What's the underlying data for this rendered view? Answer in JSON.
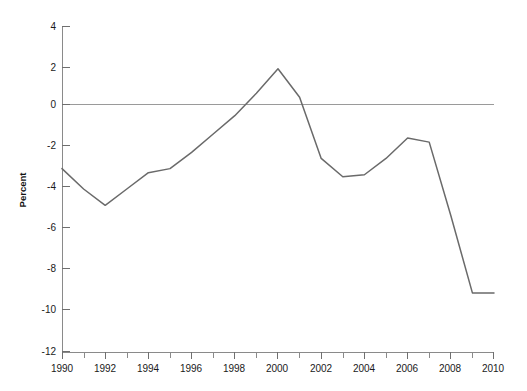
{
  "chart_data": {
    "type": "line",
    "title": "",
    "xlabel": "",
    "ylabel": "Percent",
    "x": [
      1990,
      1991,
      1992,
      1993,
      1994,
      1995,
      1996,
      1997,
      1998,
      1999,
      2000,
      2001,
      2002,
      2003,
      2004,
      2005,
      2006,
      2007,
      2008,
      2009,
      2010
    ],
    "values": [
      -3.0,
      -4.0,
      -4.8,
      -4.0,
      -3.2,
      -3.0,
      -2.2,
      -1.3,
      -0.4,
      0.7,
      1.9,
      0.5,
      -2.5,
      -3.4,
      -3.3,
      -2.5,
      -1.5,
      -1.7,
      -5.3,
      -9.1,
      -9.1
    ],
    "series": [
      {
        "name": "Percent",
        "color": "#6a6a6a",
        "values": [
          -3.0,
          -4.0,
          -4.8,
          -4.0,
          -3.2,
          -3.0,
          -2.2,
          -1.3,
          -0.4,
          0.7,
          1.9,
          0.5,
          -2.5,
          -3.4,
          -3.3,
          -2.5,
          -1.5,
          -1.7,
          -5.3,
          -9.1,
          -9.1
        ]
      }
    ],
    "xlim": [
      1990,
      2010
    ],
    "ylim": [
      -12,
      4
    ],
    "y_ticks": [
      4,
      2,
      0,
      -2,
      -4,
      -6,
      -8,
      -10,
      -12
    ],
    "y_tick_labels": [
      "4",
      "2",
      "0",
      "-2",
      "-4",
      "-6",
      "-8",
      "-10",
      "-12"
    ],
    "x_ticks": [
      1990,
      1992,
      1994,
      1996,
      1998,
      2000,
      2002,
      2004,
      2006,
      2008,
      2010
    ],
    "x_tick_labels": [
      "1990",
      "1992",
      "1994",
      "1996",
      "1998",
      "2000",
      "2002",
      "2004",
      "2006",
      "2008",
      "2010"
    ],
    "x_minor_ticks": [
      1991,
      1993,
      1995,
      1997,
      1999,
      2001,
      2003,
      2005,
      2007,
      2009
    ],
    "grid": false,
    "zero_line": true,
    "legend": "none"
  },
  "axis": {
    "y_title": "Percent"
  },
  "plot_geometry": {
    "left": 62,
    "right": 494,
    "top": 26,
    "bottom": 352,
    "zero_y": 104
  }
}
